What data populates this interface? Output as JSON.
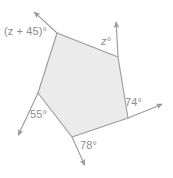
{
  "figure": {
    "shape_name": "pentagon",
    "fill_color": "#ebebeb",
    "stroke_color": "#9a9a9a",
    "label_color": "#8d8d8d",
    "background_color": "#ffffff"
  },
  "labels": {
    "top_left": "(z + 45)°",
    "top_right": "z°",
    "right": "74°",
    "bottom": "78°",
    "left": "55°"
  },
  "chart_data": {
    "type": "diagram",
    "vertices": [
      {
        "name": "top-left",
        "x": 57,
        "y": 33
      },
      {
        "name": "top-right",
        "x": 118,
        "y": 57
      },
      {
        "name": "bottom-right",
        "x": 128,
        "y": 118
      },
      {
        "name": "bottom",
        "x": 72,
        "y": 137
      },
      {
        "name": "left",
        "x": 38,
        "y": 93
      }
    ],
    "rays": [
      {
        "name": "top-left-ray",
        "from_x": 57,
        "from_y": 33,
        "to_x": 32,
        "to_y": 10,
        "arrow": true
      },
      {
        "name": "top-right-ray",
        "from_x": 118,
        "from_y": 57,
        "to_x": 116,
        "to_y": 19,
        "arrow": true
      },
      {
        "name": "right-ray",
        "from_x": 128,
        "from_y": 118,
        "to_x": 165,
        "to_y": 103,
        "arrow": true
      },
      {
        "name": "bottom-ray",
        "from_x": 72,
        "from_y": 137,
        "to_x": 86,
        "to_y": 168,
        "arrow": true
      },
      {
        "name": "left-ray",
        "from_x": 38,
        "from_y": 93,
        "to_x": 17,
        "to_y": 138,
        "arrow": true
      }
    ],
    "angle_labels": [
      {
        "name": "top-left-angle",
        "text": "(z + 45)°",
        "x": 4,
        "y": 26
      },
      {
        "name": "top-right-angle",
        "text": "z°",
        "x": 101,
        "y": 36
      },
      {
        "name": "right-angle",
        "text": "74°",
        "x": 125,
        "y": 97
      },
      {
        "name": "bottom-angle",
        "text": "78°",
        "x": 80,
        "y": 140
      },
      {
        "name": "left-angle",
        "text": "55°",
        "x": 30,
        "y": 109
      }
    ],
    "known_values": [
      74,
      78,
      55
    ],
    "unknown_values": [
      "z",
      "z + 45"
    ],
    "xlabel": "",
    "ylabel": "",
    "grid": false,
    "legend": false
  }
}
